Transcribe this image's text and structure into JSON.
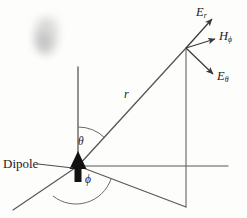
{
  "figure": {
    "background_color": "#fdfdfc",
    "line_color": "#4a4a4a",
    "ink_color": "#1b1b1b",
    "width": 247,
    "height": 218
  },
  "labels": {
    "dipole": "Dipole",
    "r": "r",
    "theta": "θ",
    "phi": "ϕ",
    "E_r_base": "E",
    "E_r_sub": "r",
    "H_phi_base": "H",
    "H_phi_sub": "ϕ",
    "E_theta_base": "E",
    "E_theta_sub": "θ"
  },
  "geometry": {
    "origin": {
      "x": 78,
      "y": 166
    },
    "field_point": {
      "x": 186,
      "y": 48
    },
    "z_axis_top": {
      "x": 78,
      "y": 67
    },
    "x_axis_end": {
      "x": 13,
      "y": 210
    },
    "y_axis_end": {
      "x": 228,
      "y": 166
    },
    "ground_projection": {
      "x": 186,
      "y": 207
    },
    "vectors": [
      {
        "name": "E_r",
        "from": {
          "x": 186,
          "y": 48
        },
        "to": {
          "x": 213,
          "y": 18
        }
      },
      {
        "name": "H_phi",
        "from": {
          "x": 186,
          "y": 48
        },
        "to": {
          "x": 216,
          "y": 39
        }
      },
      {
        "name": "E_theta",
        "from": {
          "x": 186,
          "y": 48
        },
        "to": {
          "x": 214,
          "y": 75
        }
      }
    ],
    "angles": [
      {
        "name": "theta",
        "between": [
          "z-axis",
          "r-vector"
        ],
        "label": "θ"
      },
      {
        "name": "phi",
        "between": [
          "x-axis",
          "ground-projection"
        ],
        "label": "ϕ"
      }
    ]
  },
  "artifacts": {
    "smudge": {
      "x": 32,
      "y": 18,
      "width": 28,
      "height": 40,
      "color": "#d9d9d9"
    }
  }
}
